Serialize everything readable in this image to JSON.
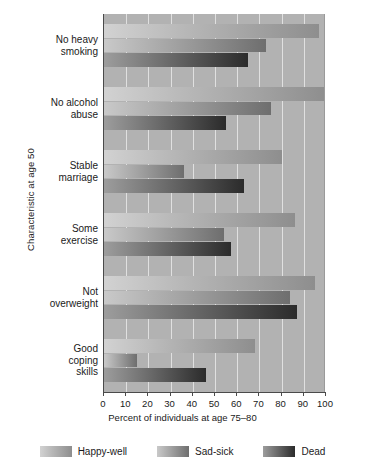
{
  "chart_data": {
    "type": "bar",
    "orientation": "horizontal",
    "title": "",
    "xlabel": "Percent of individuals at age 75–80",
    "ylabel": "Characteristic at age 50",
    "xlim": [
      0,
      100
    ],
    "xticks": [
      0,
      10,
      20,
      30,
      40,
      50,
      60,
      70,
      80,
      90,
      100
    ],
    "xticklabels": [
      "0",
      "10",
      "20",
      "30",
      "40",
      "50",
      "60",
      "70",
      "80",
      "90",
      "100"
    ],
    "grid": true,
    "grid_axis": "x",
    "legend_position": "bottom",
    "categories": [
      "No heavy smoking",
      "No alcohol abuse",
      "Stable marriage",
      "Some exercise",
      "Not overweight",
      "Good coping skills"
    ],
    "category_lines": [
      [
        "No heavy",
        "smoking"
      ],
      [
        "No alcohol",
        "abuse"
      ],
      [
        "Stable",
        "marriage"
      ],
      [
        "Some",
        "exercise"
      ],
      [
        "Not",
        "overweight"
      ],
      [
        "Good",
        "coping",
        "skills"
      ]
    ],
    "series": [
      {
        "name": "Happy-well",
        "color": "#b9b9b9",
        "values": [
          97,
          100,
          80,
          86,
          95,
          68
        ]
      },
      {
        "name": "Sad-sick",
        "color": "#a5a5a5",
        "values": [
          73,
          75,
          36,
          54,
          84,
          15
        ]
      },
      {
        "name": "Dead",
        "color": "#6a6a6a",
        "values": [
          65,
          55,
          63,
          57,
          87,
          46
        ]
      }
    ],
    "plot_background": "#b2b2b2",
    "gridline_color": "#e8e8e8",
    "axis_color": "#4a4a4a"
  },
  "legend": {
    "items": [
      {
        "label": "Happy-well"
      },
      {
        "label": "Sad-sick"
      },
      {
        "label": "Dead"
      }
    ]
  }
}
